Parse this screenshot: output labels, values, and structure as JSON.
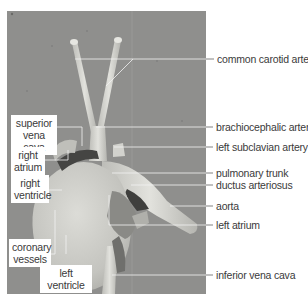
{
  "figure": {
    "colors": {
      "background": "#ffffff",
      "photo_backdrop": "#8f8f8d",
      "tissue": "#cfcfca",
      "leader_line": "#555555",
      "label_text": "#3a3a3a"
    }
  },
  "labels_right": [
    {
      "id": "common-carotid-arteries",
      "text": "common carotid arteries"
    },
    {
      "id": "brachiocephalic-artery",
      "text": "brachiocephalic artery"
    },
    {
      "id": "left-subclavian-artery",
      "text": "left subclavian artery"
    },
    {
      "id": "pulmonary-trunk",
      "text": "pulmonary trunk"
    },
    {
      "id": "ductus-arteriosus",
      "text": "ductus arteriosus"
    },
    {
      "id": "aorta",
      "text": "aorta"
    },
    {
      "id": "left-atrium",
      "text": "left atrium"
    },
    {
      "id": "inferior-vena-cava",
      "text": "inferior vena cava"
    }
  ],
  "labels_left": [
    {
      "id": "superior-vena-cava",
      "line1": "superior",
      "line2": "vena cava"
    },
    {
      "id": "right-atrium",
      "line1": "right",
      "line2": "atrium"
    },
    {
      "id": "right-ventricle",
      "line1": "right",
      "line2": "ventricle"
    },
    {
      "id": "coronary-vessels",
      "line1": "coronary",
      "line2": "vessels"
    },
    {
      "id": "left-ventricle",
      "line1": "left ventricle"
    }
  ]
}
